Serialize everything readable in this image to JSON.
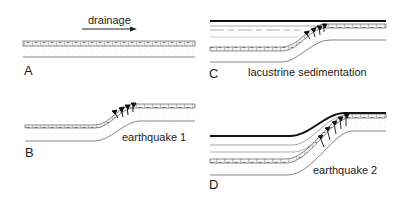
{
  "diagram": {
    "type": "geological-cross-section-sequence",
    "panels": [
      {
        "id": "A",
        "letter": "A",
        "caption": "",
        "stage": "initial flat layered sediments"
      },
      {
        "id": "B",
        "letter": "B",
        "caption": "earthquake 1",
        "stage": "fault scarp / monocline formed"
      },
      {
        "id": "C",
        "letter": "C",
        "caption": "lacustrine sedimentation",
        "stage": "lake deposits onlap scarp"
      },
      {
        "id": "D",
        "letter": "D",
        "caption": "earthquake 2",
        "stage": "second deformation of lake deposits"
      }
    ],
    "flow": {
      "label": "drainage",
      "direction": "right",
      "icon": "arrow-right-icon"
    },
    "colors": {
      "line": "#2a2a2a",
      "bed_fill": "#e8e8e8",
      "sand": "#c8c8c8",
      "background": "#ffffff"
    }
  }
}
